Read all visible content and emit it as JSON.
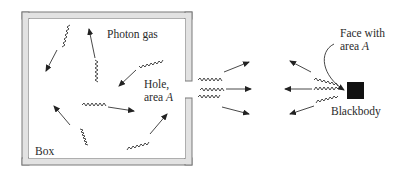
{
  "diagram": {
    "labels": {
      "photon_gas": "Photon gas",
      "hole_line1": "Hole,",
      "hole_line2_prefix": "area ",
      "hole_line2_var": "A",
      "box": "Box",
      "face_line1": "Face with",
      "face_line2_prefix": "area ",
      "face_line2_var": "A",
      "blackbody": "Blackbody"
    },
    "colors": {
      "wall_fill": "#e2e2e2",
      "wall_stroke": "#7a7a7a",
      "blackbody": "#111111",
      "arrow": "#333333"
    }
  }
}
